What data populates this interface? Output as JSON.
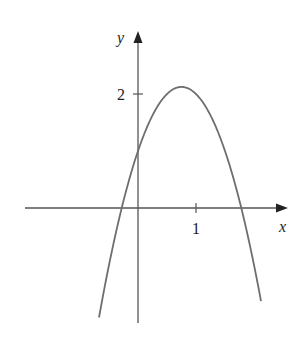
{
  "chart_data": {
    "type": "line",
    "title": "",
    "xlabel": "x",
    "ylabel": "y",
    "x_ticks": [
      {
        "value": 1,
        "label": "1"
      }
    ],
    "y_ticks": [
      {
        "value": 2,
        "label": "2"
      }
    ],
    "grid": false,
    "legend": null,
    "series": [
      {
        "name": "parabola (approx. y = 1 + 3x - 2x^2)",
        "x": [
          -0.7,
          -0.5,
          -0.28,
          0,
          0.25,
          0.5,
          0.75,
          1.0,
          1.25,
          1.5,
          1.78,
          2.0,
          2.2
        ],
        "values": [
          -2.08,
          -1.0,
          0.0,
          1.0,
          1.63,
          2.0,
          2.125,
          2.0,
          1.63,
          1.0,
          0.0,
          -1.0,
          -2.08
        ]
      }
    ],
    "xlim": [
      -1.95,
      2.5
    ],
    "ylim": [
      -2.0,
      3.1
    ]
  },
  "labels": {
    "x_axis": "x",
    "y_axis": "y",
    "tick_x1": "1",
    "tick_y2": "2"
  },
  "colors": {
    "axis": "#555555",
    "curve": "#6e6e6e",
    "text": "#222222"
  }
}
